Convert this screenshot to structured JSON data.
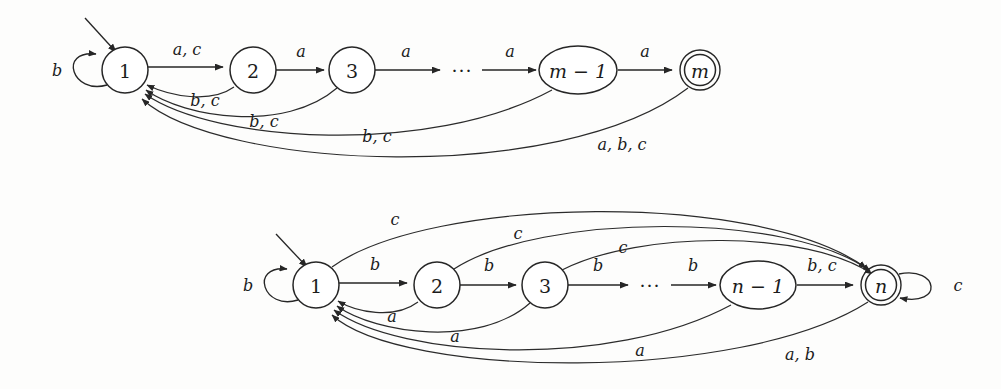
{
  "figure": {
    "kind": "finite-automata-diagram",
    "background_color": "#fdfdfc",
    "ink_color": "#262626",
    "ellipsis": "···"
  },
  "automaton_top": {
    "name": "automaton-m",
    "alphabet": [
      "a",
      "b",
      "c"
    ],
    "start_state": "1",
    "accepting_states": [
      "m"
    ],
    "states": [
      {
        "id": "s1",
        "label": "1",
        "shape": "circle",
        "cx": 125,
        "cy": 70,
        "r": 23,
        "accepting": false,
        "start": true
      },
      {
        "id": "s2",
        "label": "2",
        "shape": "circle",
        "cx": 253,
        "cy": 70,
        "r": 23,
        "accepting": false,
        "start": false
      },
      {
        "id": "s3",
        "label": "3",
        "shape": "circle",
        "cx": 352,
        "cy": 70,
        "r": 23,
        "accepting": false,
        "start": false
      },
      {
        "id": "sm1",
        "label": "m − 1",
        "shape": "ellipse",
        "cx": 578,
        "cy": 70,
        "rx": 39,
        "ry": 24,
        "accepting": false,
        "start": false
      },
      {
        "id": "sm",
        "label": "m",
        "shape": "circle",
        "cx": 700,
        "cy": 70,
        "r": 20,
        "accepting": true,
        "start": false
      }
    ],
    "ellipsis_x": 462,
    "ellipsis_y": 70,
    "transitions": [
      {
        "from": "s1",
        "to": "s1",
        "label": "b",
        "kind": "self-loop-left"
      },
      {
        "from": "s1",
        "to": "s2",
        "label": "a, c",
        "kind": "forward"
      },
      {
        "from": "s2",
        "to": "s3",
        "label": "a",
        "kind": "forward"
      },
      {
        "from": "s3",
        "to": "dots",
        "label": "a",
        "kind": "forward"
      },
      {
        "from": "dots",
        "to": "sm1",
        "label": "a",
        "kind": "forward"
      },
      {
        "from": "sm1",
        "to": "sm",
        "label": "a",
        "kind": "forward"
      },
      {
        "from": "s2",
        "to": "s1",
        "label": "b, c",
        "kind": "back-arc-1"
      },
      {
        "from": "s3",
        "to": "s1",
        "label": "b, c",
        "kind": "back-arc-2"
      },
      {
        "from": "sm1",
        "to": "s1",
        "label": "b, c",
        "kind": "back-arc-3"
      },
      {
        "from": "sm",
        "to": "s1",
        "label": "a, b, c",
        "kind": "back-arc-4"
      }
    ],
    "edge_labels": {
      "self_loop": "b",
      "one_to_two": "a, c",
      "two_to_three": "a",
      "three_to_dots": "a",
      "dots_to_m1": "a",
      "m1_to_m": "a",
      "back_from_two": "b, c",
      "back_from_three": "b, c",
      "back_from_m1": "b, c",
      "back_from_m": "a, b, c"
    }
  },
  "automaton_bottom": {
    "name": "automaton-n",
    "alphabet": [
      "a",
      "b",
      "c"
    ],
    "start_state": "1",
    "accepting_states": [
      "n"
    ],
    "states": [
      {
        "id": "t1",
        "label": "1",
        "shape": "circle",
        "cx": 316,
        "cy": 285,
        "r": 23,
        "accepting": false,
        "start": true
      },
      {
        "id": "t2",
        "label": "2",
        "shape": "circle",
        "cx": 437,
        "cy": 285,
        "r": 23,
        "accepting": false,
        "start": false
      },
      {
        "id": "t3",
        "label": "3",
        "shape": "circle",
        "cx": 545,
        "cy": 285,
        "r": 23,
        "accepting": false,
        "start": false
      },
      {
        "id": "tn1",
        "label": "n − 1",
        "shape": "ellipse",
        "cx": 758,
        "cy": 285,
        "rx": 38,
        "ry": 24,
        "accepting": false,
        "start": false
      },
      {
        "id": "tn",
        "label": "n",
        "shape": "circle",
        "cx": 881,
        "cy": 285,
        "r": 20,
        "accepting": true,
        "start": false
      }
    ],
    "ellipsis_x": 650,
    "ellipsis_y": 285,
    "transitions": [
      {
        "from": "t1",
        "to": "t1",
        "label": "b",
        "kind": "self-loop-left"
      },
      {
        "from": "tn",
        "to": "tn",
        "label": "c",
        "kind": "self-loop-right"
      },
      {
        "from": "t1",
        "to": "t2",
        "label": "b",
        "kind": "forward"
      },
      {
        "from": "t2",
        "to": "t3",
        "label": "b",
        "kind": "forward"
      },
      {
        "from": "t3",
        "to": "dots",
        "label": "b",
        "kind": "forward"
      },
      {
        "from": "dots",
        "to": "tn1",
        "label": "b",
        "kind": "forward"
      },
      {
        "from": "tn1",
        "to": "tn",
        "label": "b, c",
        "kind": "forward"
      },
      {
        "from": "t1",
        "to": "tn",
        "label": "c",
        "kind": "over-arc-1"
      },
      {
        "from": "t2",
        "to": "tn",
        "label": "c",
        "kind": "over-arc-2"
      },
      {
        "from": "t3",
        "to": "tn",
        "label": "c",
        "kind": "over-arc-3"
      },
      {
        "from": "t2",
        "to": "t1",
        "label": "a",
        "kind": "back-arc-1"
      },
      {
        "from": "t3",
        "to": "t1",
        "label": "a",
        "kind": "back-arc-2"
      },
      {
        "from": "tn1",
        "to": "t1",
        "label": "a",
        "kind": "back-arc-3"
      },
      {
        "from": "tn",
        "to": "t1",
        "label": "a, b",
        "kind": "back-arc-4"
      }
    ],
    "edge_labels": {
      "self_loop_start": "b",
      "self_loop_accept": "c",
      "one_to_two": "b",
      "two_to_three": "b",
      "three_to_dots": "b",
      "dots_to_n1": "b",
      "n1_to_n": "b, c",
      "over_from_one": "c",
      "over_from_two": "c",
      "over_from_three": "c",
      "back_from_two": "a",
      "back_from_three": "a",
      "back_from_n1": "a",
      "back_from_n": "a, b"
    }
  }
}
